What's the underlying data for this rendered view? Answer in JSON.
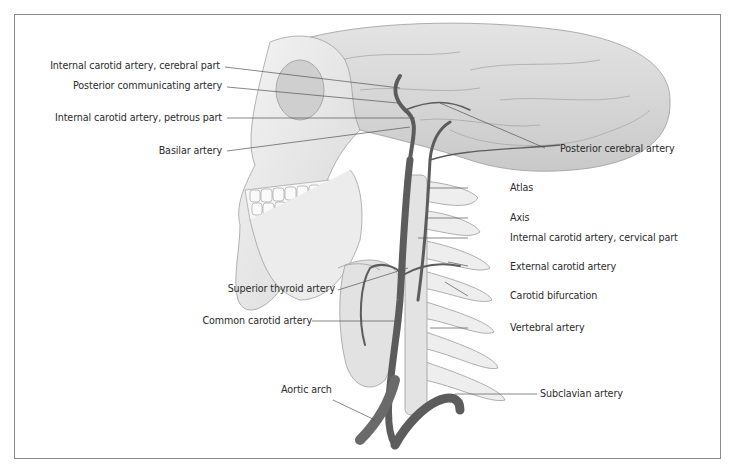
{
  "figure": {
    "labels_left": [
      {
        "id": "ica-cerebral",
        "text": "Internal carotid artery, cerebral part"
      },
      {
        "id": "pcom",
        "text": "Posterior communicating artery"
      },
      {
        "id": "ica-petrous",
        "text": "Internal carotid artery, petrous part"
      },
      {
        "id": "basilar",
        "text": "Basilar artery"
      },
      {
        "id": "sup-thyroid",
        "text": "Superior thyroid artery"
      },
      {
        "id": "cca",
        "text": "Common carotid artery"
      },
      {
        "id": "aortic-arch",
        "text": "Aortic arch"
      }
    ],
    "labels_right": [
      {
        "id": "pca",
        "text": "Posterior cerebral artery"
      },
      {
        "id": "atlas",
        "text": "Atlas"
      },
      {
        "id": "axis",
        "text": "Axis"
      },
      {
        "id": "ica-cervical",
        "text": "Internal carotid artery, cervical part"
      },
      {
        "id": "eca",
        "text": "External carotid artery"
      },
      {
        "id": "bifurcation",
        "text": "Carotid bifurcation"
      },
      {
        "id": "vertebral",
        "text": "Vertebral artery"
      },
      {
        "id": "subclavian",
        "text": "Subclavian artery"
      }
    ],
    "colors": {
      "frame": "#8a8a8a",
      "leader_line": "#555555",
      "bone": "#e9e9e9",
      "brain": "#d6d6d6",
      "artery": "#5c5c5c"
    }
  }
}
